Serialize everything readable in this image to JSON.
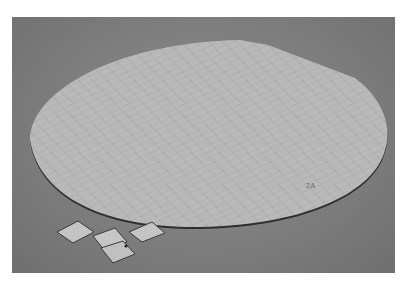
{
  "image": {
    "subject": "silicon wafer with diced chips",
    "wafer_marking": "2A",
    "chip_count": 4,
    "colors": {
      "background": "#7f7f7f",
      "wafer": "#b8b8b8",
      "wafer_edge": "#2e2e2e",
      "chip": "#c2c2c2"
    }
  }
}
